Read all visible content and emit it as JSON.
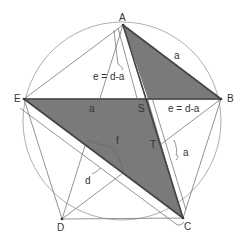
{
  "diagram": {
    "type": "regular pentagon inscribed in circle with pentagram",
    "colors": {
      "shade": "#7a7a7a",
      "line": "#555555",
      "thin": "#888888",
      "circle": "#999999",
      "text": "#333333"
    },
    "points": {
      "A": {
        "label": "A",
        "x": 123,
        "y": 25
      },
      "B": {
        "label": "B",
        "x": 221,
        "y": 99
      },
      "C": {
        "label": "C",
        "x": 183,
        "y": 218
      },
      "D": {
        "label": "D",
        "x": 62,
        "y": 219
      },
      "E": {
        "label": "E",
        "x": 24,
        "y": 99
      },
      "S": {
        "label": "S",
        "x": 148,
        "y": 99
      },
      "T": {
        "label": "T",
        "x": 160,
        "y": 144
      }
    },
    "labels": {
      "A": "A",
      "B": "B",
      "C": "C",
      "D": "D",
      "E": "E",
      "S": "S",
      "T": "T",
      "side_a_top": "a",
      "e_left": "e = d-a",
      "e_right": "e = d-a",
      "a_mid": "a",
      "a_right": "a",
      "f": "f",
      "d": "d"
    }
  }
}
